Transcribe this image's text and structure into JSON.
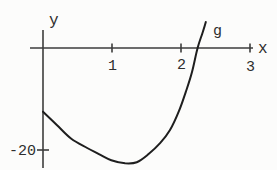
{
  "figure": {
    "background_color": "#fcfcfb",
    "axis_color": "#3d3d3d",
    "curve_color": "#1e1e1e",
    "x_axis_label": "x",
    "y_axis_label": "y",
    "curve_label": "g",
    "x_tick_labels": [
      "1",
      "2",
      "3"
    ],
    "y_tick_label": "-20"
  },
  "chart_data": {
    "type": "line",
    "title": "",
    "xlabel": "x",
    "ylabel": "y",
    "xlim": [
      -0.2,
      3.3
    ],
    "ylim": [
      -24,
      7
    ],
    "grid": false,
    "x_tick_values": [
      1,
      2,
      3
    ],
    "y_tick_values": [
      -20
    ],
    "series": [
      {
        "name": "g",
        "points": [
          [
            0,
            -12.5
          ],
          [
            0.2,
            -15.1
          ],
          [
            0.41,
            -17.8
          ],
          [
            0.64,
            -19.6
          ],
          [
            0.81,
            -20.8
          ],
          [
            0.99,
            -22.0
          ],
          [
            1.19,
            -22.6
          ],
          [
            1.36,
            -22.4
          ],
          [
            1.53,
            -20.8
          ],
          [
            1.7,
            -18.6
          ],
          [
            1.84,
            -16.1
          ],
          [
            1.97,
            -12.4
          ],
          [
            2.07,
            -8.6
          ],
          [
            2.16,
            -4.7
          ],
          [
            2.24,
            0
          ],
          [
            2.31,
            2.9
          ],
          [
            2.36,
            5.1
          ]
        ]
      }
    ],
    "features": {
      "y_intercept": -12.5,
      "x_intercept": 2.24,
      "minimum_point": [
        1.2,
        -22.6
      ]
    }
  }
}
